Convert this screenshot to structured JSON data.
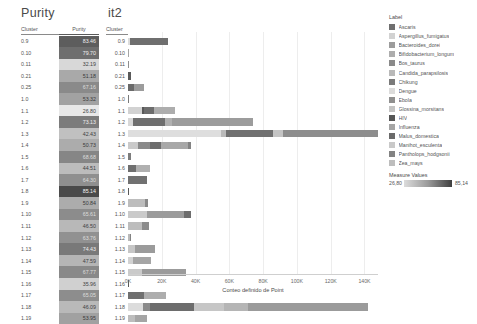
{
  "titles": {
    "purity": "Purity",
    "it2": "it2"
  },
  "purity_table": {
    "headers": {
      "cluster": "Cluster",
      "purity": "Purity"
    },
    "rows": [
      {
        "cluster": "0.9",
        "purity": "83.46",
        "bg": "#5d5d5d",
        "fg": "#f0f0f0"
      },
      {
        "cluster": "0.10",
        "purity": "79.70",
        "bg": "#6e6e6e",
        "fg": "#f0f0f0"
      },
      {
        "cluster": "0.11",
        "purity": "32.19",
        "bg": "#d8d8d8",
        "fg": "#444444"
      },
      {
        "cluster": "0.21",
        "purity": "51.18",
        "bg": "#a9a9a9",
        "fg": "#3a3a3a"
      },
      {
        "cluster": "0.25",
        "purity": "67.16",
        "bg": "#8a8a8a",
        "fg": "#dddddd"
      },
      {
        "cluster": "1.0",
        "purity": "53.32",
        "bg": "#a2a2a2",
        "fg": "#3a3a3a"
      },
      {
        "cluster": "1.1",
        "purity": "26.80",
        "bg": "#e8e8e8",
        "fg": "#444444"
      },
      {
        "cluster": "1.2",
        "purity": "73.13",
        "bg": "#7c7c7c",
        "fg": "#eeeeee"
      },
      {
        "cluster": "1.3",
        "purity": "42.43",
        "bg": "#c0c0c0",
        "fg": "#3f3f3f"
      },
      {
        "cluster": "1.4",
        "purity": "50.73",
        "bg": "#acacac",
        "fg": "#3a3a3a"
      },
      {
        "cluster": "1.5",
        "purity": "68.68",
        "bg": "#868686",
        "fg": "#dddddd"
      },
      {
        "cluster": "1.6",
        "purity": "44.51",
        "bg": "#bcbcbc",
        "fg": "#3f3f3f"
      },
      {
        "cluster": "1.7",
        "purity": "64.30",
        "bg": "#8f8f8f",
        "fg": "#dddddd"
      },
      {
        "cluster": "1.8",
        "purity": "85.14",
        "bg": "#4a4a4a",
        "fg": "#f4f4f4"
      },
      {
        "cluster": "1.9",
        "purity": "50.84",
        "bg": "#acacac",
        "fg": "#3a3a3a"
      },
      {
        "cluster": "1.10",
        "purity": "65.61",
        "bg": "#8c8c8c",
        "fg": "#dddddd"
      },
      {
        "cluster": "1.11",
        "purity": "46.50",
        "bg": "#b8b8b8",
        "fg": "#3f3f3f"
      },
      {
        "cluster": "1.12",
        "purity": "63.76",
        "bg": "#919191",
        "fg": "#dddddd"
      },
      {
        "cluster": "1.13",
        "purity": "74.43",
        "bg": "#797979",
        "fg": "#eeeeee"
      },
      {
        "cluster": "1.14",
        "purity": "47.59",
        "bg": "#b5b5b5",
        "fg": "#3f3f3f"
      },
      {
        "cluster": "1.15",
        "purity": "67.77",
        "bg": "#898989",
        "fg": "#dddddd"
      },
      {
        "cluster": "1.16",
        "purity": "35.96",
        "bg": "#d0d0d0",
        "fg": "#444444"
      },
      {
        "cluster": "1.17",
        "purity": "65.05",
        "bg": "#8d8d8d",
        "fg": "#dddddd"
      },
      {
        "cluster": "1.18",
        "purity": "46.09",
        "bg": "#b9b9b9",
        "fg": "#3f3f3f"
      },
      {
        "cluster": "1.19",
        "purity": "53.95",
        "bg": "#a1a1a1",
        "fg": "#3a3a3a"
      }
    ]
  },
  "legend": {
    "title": "Label",
    "items": [
      {
        "label": "Ascaris",
        "color": "#6f6f6f"
      },
      {
        "label": "Aspergillus_fumigatus",
        "color": "#d2d2d2"
      },
      {
        "label": "Bacteroides_dorei",
        "color": "#9c9c9c"
      },
      {
        "label": "Bifidobacterium_longum",
        "color": "#adadad"
      },
      {
        "label": "Bos_taurus",
        "color": "#8a8a8a"
      },
      {
        "label": "Candida_parapsilosis",
        "color": "#b9b9b9"
      },
      {
        "label": "Chikung",
        "color": "#7a7a7a"
      },
      {
        "label": "Dengue",
        "color": "#dcdcdc"
      },
      {
        "label": "Ebola",
        "color": "#8f8f8f"
      },
      {
        "label": "Glossina_morsitans",
        "color": "#c4c4c4"
      },
      {
        "label": "HIV",
        "color": "#565656"
      },
      {
        "label": "Influenza",
        "color": "#a5a5a5"
      },
      {
        "label": "Malus_domestica",
        "color": "#6a6a6a"
      },
      {
        "label": "Manihot_esculenta",
        "color": "#c9c9c9"
      },
      {
        "label": "Pantholops_hodgsonii",
        "color": "#838383"
      },
      {
        "label": "Zea_mays",
        "color": "#bdbdbd"
      }
    ]
  },
  "measure_values": {
    "title": "Measure Values",
    "min": "26,80",
    "max": "85,14"
  },
  "chart_data": {
    "type": "bar",
    "orientation": "horizontal",
    "stacked": true,
    "title": "it2",
    "xlabel": "Conteo definido de Point",
    "ylabel": "Cluster",
    "xlim": [
      0,
      148000
    ],
    "grid": true,
    "legend_position": "right",
    "xticks": [
      "0K",
      "20K",
      "40K",
      "60K",
      "80K",
      "100K",
      "120K",
      "140K"
    ],
    "xtick_values": [
      0,
      20000,
      40000,
      60000,
      80000,
      100000,
      120000,
      140000
    ],
    "categories": [
      "0.9",
      "0.10",
      "0.11",
      "0.21",
      "0.25",
      "1.0",
      "1.1",
      "1.2",
      "1.3",
      "1.4",
      "1.5",
      "1.6",
      "1.7",
      "1.8",
      "1.9",
      "1.10",
      "1.11",
      "1.12",
      "1.13",
      "1.14",
      "1.15",
      "1.16",
      "1.17",
      "1.18",
      "1.19"
    ],
    "totals": [
      23500,
      700,
      600,
      2000,
      9200,
      700,
      28000,
      74000,
      148000,
      37500,
      1500,
      13000,
      11500,
      400,
      12000,
      37500,
      12500,
      2000,
      16000,
      13500,
      34500,
      500,
      22500,
      142000,
      11000
    ],
    "rows": [
      {
        "cluster": "0.9",
        "segments": [
          {
            "label": "Dengue",
            "value": 1200,
            "color": "#dcdcdc"
          },
          {
            "label": "Ascaris",
            "value": 22300,
            "color": "#6f6f6f"
          }
        ]
      },
      {
        "cluster": "0.10",
        "segments": [
          {
            "label": "Influenza",
            "value": 700,
            "color": "#a5a5a5"
          }
        ]
      },
      {
        "cluster": "0.11",
        "segments": [
          {
            "label": "Ebola",
            "value": 600,
            "color": "#8f8f8f"
          }
        ]
      },
      {
        "cluster": "0.21",
        "segments": [
          {
            "label": "HIV",
            "value": 2000,
            "color": "#5a5a5a"
          }
        ]
      },
      {
        "cluster": "0.25",
        "segments": [
          {
            "label": "Malus_domestica",
            "value": 3400,
            "color": "#6a6a6a"
          },
          {
            "label": "Bacteroides_dorei",
            "value": 5800,
            "color": "#9c9c9c"
          }
        ]
      },
      {
        "cluster": "1.0",
        "segments": [
          {
            "label": "Chikung",
            "value": 700,
            "color": "#7a7a7a"
          }
        ]
      },
      {
        "cluster": "1.1",
        "segments": [
          {
            "label": "Aspergillus_fumigatus",
            "value": 8000,
            "color": "#d2d2d2"
          },
          {
            "label": "HIV",
            "value": 1200,
            "color": "#585858"
          },
          {
            "label": "Malus_domestica",
            "value": 6500,
            "color": "#6d6d6d"
          },
          {
            "label": "Bifidobacterium_longum",
            "value": 12300,
            "color": "#adadad"
          }
        ]
      },
      {
        "cluster": "1.2",
        "segments": [
          {
            "label": "Dengue",
            "value": 3000,
            "color": "#d8d8d8"
          },
          {
            "label": "Malus_domestica",
            "value": 19000,
            "color": "#6f6f6f"
          },
          {
            "label": "Bifidobacterium_longum",
            "value": 4000,
            "color": "#b0b0b0"
          },
          {
            "label": "Bacteroides_dorei",
            "value": 48000,
            "color": "#9c9c9c"
          }
        ]
      },
      {
        "cluster": "1.3",
        "segments": [
          {
            "label": "Dengue",
            "value": 55000,
            "color": "#dedede"
          },
          {
            "label": "Candida_parapsilosis",
            "value": 3000,
            "color": "#bababa"
          },
          {
            "label": "Ascaris",
            "value": 28000,
            "color": "#707070"
          },
          {
            "label": "Glossina_morsitans",
            "value": 6000,
            "color": "#c4c4c4"
          },
          {
            "label": "Ebola",
            "value": 56000,
            "color": "#8d8d8d"
          }
        ]
      },
      {
        "cluster": "1.4",
        "segments": [
          {
            "label": "Manihot_esculenta",
            "value": 6000,
            "color": "#cacaca"
          },
          {
            "label": "Bos_taurus",
            "value": 7000,
            "color": "#8a8a8a"
          },
          {
            "label": "Malus_domestica",
            "value": 6500,
            "color": "#6d6d6d"
          },
          {
            "label": "Influenza",
            "value": 16000,
            "color": "#a8a8a8"
          },
          {
            "label": "Pantholops_hodgsonii",
            "value": 2000,
            "color": "#838383"
          }
        ]
      },
      {
        "cluster": "1.5",
        "segments": [
          {
            "label": "Chikung",
            "value": 1500,
            "color": "#7d7d7d"
          }
        ]
      },
      {
        "cluster": "1.6",
        "segments": [
          {
            "label": "Malus_domestica",
            "value": 5000,
            "color": "#6f6f6f"
          },
          {
            "label": "Bifidobacterium_longum",
            "value": 8000,
            "color": "#b0b0b0"
          }
        ]
      },
      {
        "cluster": "1.7",
        "segments": [
          {
            "label": "Ascaris",
            "value": 11500,
            "color": "#717171"
          }
        ]
      },
      {
        "cluster": "1.8",
        "segments": [
          {
            "label": "HIV",
            "value": 400,
            "color": "#585858"
          }
        ]
      },
      {
        "cluster": "1.9",
        "segments": [
          {
            "label": "Zea_mays",
            "value": 10000,
            "color": "#bdbdbd"
          },
          {
            "label": "Bos_taurus",
            "value": 2000,
            "color": "#8a8a8a"
          }
        ]
      },
      {
        "cluster": "1.10",
        "segments": [
          {
            "label": "Manihot_esculenta",
            "value": 11000,
            "color": "#cacaca"
          },
          {
            "label": "Bacteroides_dorei",
            "value": 22000,
            "color": "#9b9b9b"
          },
          {
            "label": "Malus_domestica",
            "value": 4500,
            "color": "#6d6d6d"
          }
        ]
      },
      {
        "cluster": "1.11",
        "segments": [
          {
            "label": "Zea_mays",
            "value": 8500,
            "color": "#bdbdbd"
          },
          {
            "label": "Bos_taurus",
            "value": 4000,
            "color": "#8c8c8c"
          }
        ]
      },
      {
        "cluster": "1.12",
        "segments": [
          {
            "label": "Candida_parapsilosis",
            "value": 1200,
            "color": "#bababa"
          },
          {
            "label": "Pantholops_hodgsonii",
            "value": 800,
            "color": "#838383"
          }
        ]
      },
      {
        "cluster": "1.13",
        "segments": [
          {
            "label": "Glossina_morsitans",
            "value": 4000,
            "color": "#c6c6c6"
          },
          {
            "label": "Bacteroides_dorei",
            "value": 12000,
            "color": "#9b9b9b"
          }
        ]
      },
      {
        "cluster": "1.14",
        "segments": [
          {
            "label": "Aspergillus_fumigatus",
            "value": 3000,
            "color": "#d2d2d2"
          },
          {
            "label": "Influenza",
            "value": 10500,
            "color": "#a5a5a5"
          }
        ]
      },
      {
        "cluster": "1.15",
        "segments": [
          {
            "label": "Manihot_esculenta",
            "value": 8000,
            "color": "#cacaca"
          },
          {
            "label": "Bacteroides_dorei",
            "value": 26500,
            "color": "#9b9b9b"
          }
        ]
      },
      {
        "cluster": "1.16",
        "segments": [
          {
            "label": "HIV",
            "value": 500,
            "color": "#585858"
          }
        ]
      },
      {
        "cluster": "1.17",
        "segments": [
          {
            "label": "Malus_domestica",
            "value": 9500,
            "color": "#6f6f6f"
          },
          {
            "label": "Bifidobacterium_longum",
            "value": 13000,
            "color": "#adadad"
          }
        ]
      },
      {
        "cluster": "1.18",
        "segments": [
          {
            "label": "Dengue",
            "value": 9000,
            "color": "#dcdcdc"
          },
          {
            "label": "Bos_taurus",
            "value": 4000,
            "color": "#8a8a8a"
          },
          {
            "label": "Ascaris",
            "value": 26000,
            "color": "#6d6d6d"
          },
          {
            "label": "Manihot_esculenta",
            "value": 18000,
            "color": "#c6c6c6"
          },
          {
            "label": "Candida_parapsilosis",
            "value": 14000,
            "color": "#b5b5b5"
          },
          {
            "label": "Bacteroides_dorei",
            "value": 71000,
            "color": "#9b9b9b"
          }
        ]
      },
      {
        "cluster": "1.19",
        "segments": [
          {
            "label": "Zea_mays",
            "value": 4000,
            "color": "#bdbdbd"
          },
          {
            "label": "Influenza",
            "value": 7000,
            "color": "#a5a5a5"
          }
        ]
      }
    ]
  },
  "chart_headers": {
    "cluster": "Cluster"
  }
}
